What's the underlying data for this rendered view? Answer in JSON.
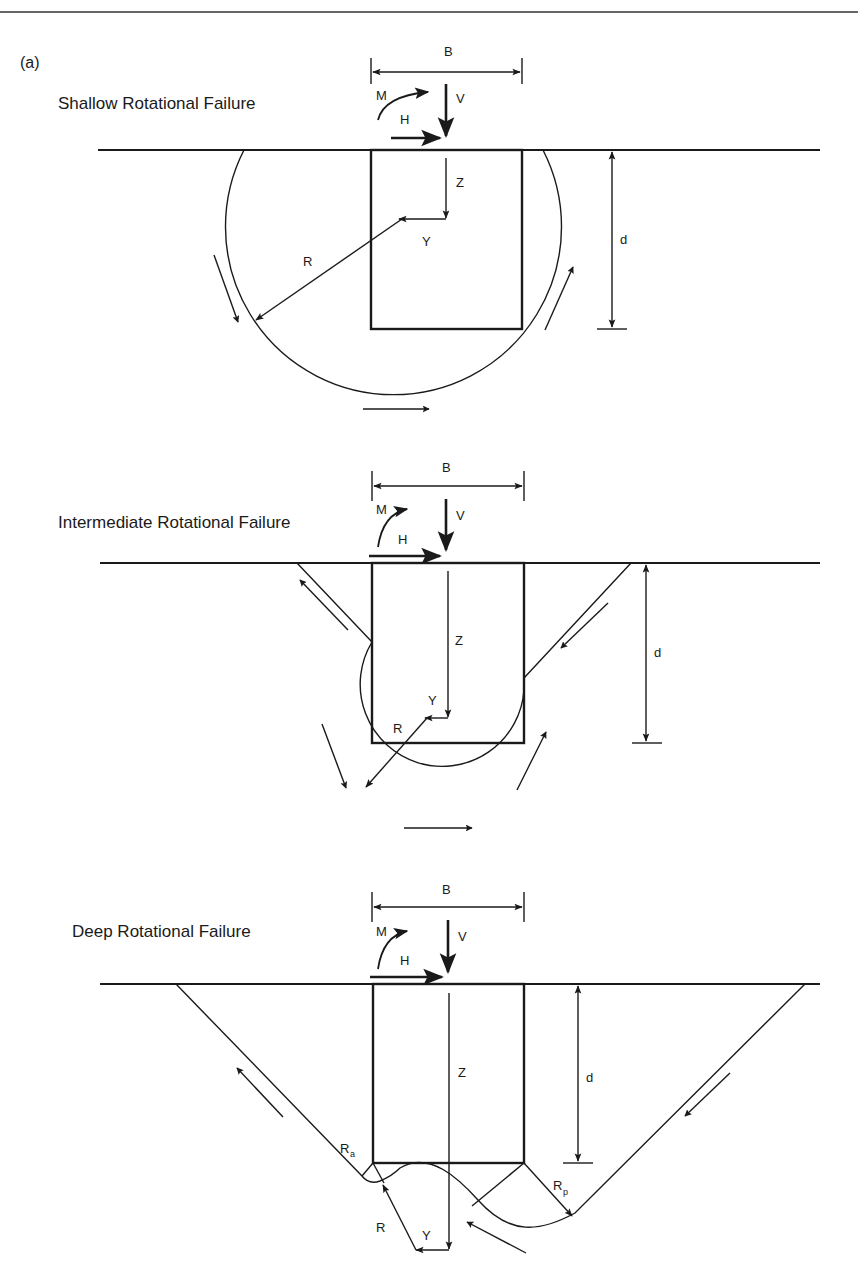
{
  "figure": {
    "panel_label": "(a)",
    "panels": [
      {
        "title": "Shallow Rotational Failure",
        "labels": {
          "width": "B",
          "moment": "M",
          "vertical": "V",
          "horizontal": "H",
          "z": "Z",
          "y": "Y",
          "radius": "R",
          "depth": "d"
        }
      },
      {
        "title": "Intermediate Rotational Failure",
        "labels": {
          "width": "B",
          "moment": "M",
          "vertical": "V",
          "horizontal": "H",
          "z": "Z",
          "y": "Y",
          "radius": "R",
          "depth": "d"
        }
      },
      {
        "title": "Deep Rotational Failure",
        "labels": {
          "width": "B",
          "moment": "M",
          "vertical": "V",
          "horizontal": "H",
          "z": "Z",
          "y": "Y",
          "radius": "R",
          "depth": "d",
          "radius_active": "R",
          "radius_active_sub": "a",
          "radius_passive": "R",
          "radius_passive_sub": "p"
        }
      }
    ]
  },
  "colors": {
    "ink": "#1a1a1a",
    "background": "#ffffff"
  }
}
